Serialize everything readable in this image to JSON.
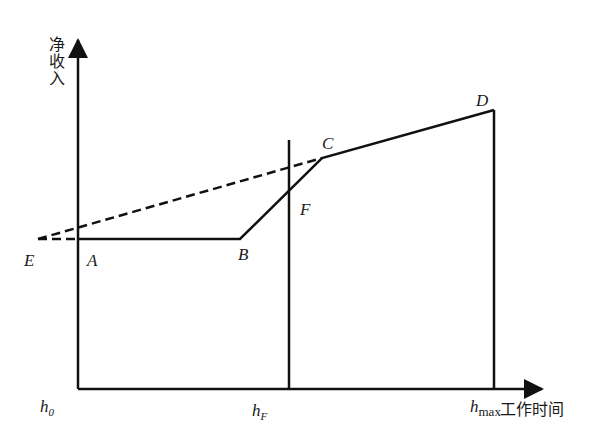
{
  "axes": {
    "y_label": "净收入",
    "x_label": "工作时间"
  },
  "ticks": {
    "h0": {
      "base": "h",
      "sub": "0"
    },
    "hF": {
      "base": "h",
      "sub": "F"
    },
    "hmax": {
      "base": "h",
      "sub": "max"
    }
  },
  "points": {
    "A": "A",
    "B": "B",
    "C": "C",
    "D": "D",
    "E": "E",
    "F": "F"
  },
  "colors": {
    "line": "#111111",
    "background": "#ffffff"
  }
}
